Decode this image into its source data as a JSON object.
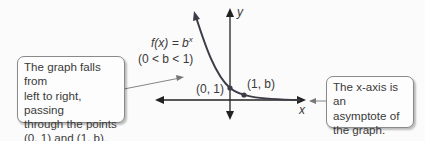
{
  "function_label": {
    "prefix": "f(x) = b",
    "exponent": "x"
  },
  "condition_label": "(0 < b < 1)",
  "point_a_label": "(0, 1)",
  "point_b_label": "(1, b)",
  "axis_x_label": "x",
  "axis_y_label": "y",
  "left_callout": {
    "lines": [
      "The graph falls from",
      "left to right, passing",
      "through the points",
      "(0, 1) and (1, b)."
    ]
  },
  "right_callout": {
    "lines": [
      "The x-axis is an",
      "asymptote of",
      "the graph."
    ]
  },
  "colors": {
    "curve": "#3d3d4a",
    "axis": "#222222",
    "point": "#3d3d4a",
    "arrow": "#777777"
  }
}
